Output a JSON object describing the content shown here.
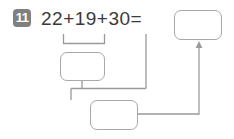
{
  "problem": {
    "number": "11",
    "equation": "22+19+30=",
    "addends": [
      "22",
      "19",
      "30"
    ],
    "operators": [
      "+",
      "+"
    ],
    "equals_sign": "="
  },
  "boxes": {
    "total": {
      "label": "answer-total",
      "value": ""
    },
    "partial_1": {
      "label": "partial-sum-22-plus-19",
      "value": ""
    },
    "partial_2": {
      "label": "partial-sum-final",
      "value": ""
    }
  },
  "connectors": {
    "bracket_label": "grouping-bracket-22-19",
    "arrow_label": "arrow-to-answer"
  },
  "colors": {
    "badge_background": "#808080",
    "badge_text": "#ffffff",
    "text": "#3a3a3a",
    "box_border": "#a8a8a8",
    "connector_line": "#9a9a9a",
    "page_background": "#ffffff"
  }
}
